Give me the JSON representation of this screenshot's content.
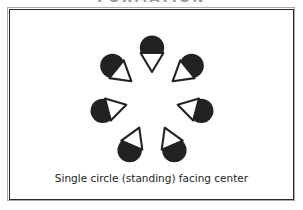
{
  "heading": {
    "text": "FORMATION",
    "clipped": true,
    "color": "#9a9a9a"
  },
  "frame": {
    "outer_border_color": "#a9a9a9",
    "inner_border_color": "#2b2b2b",
    "background_color": "#ffffff"
  },
  "caption": {
    "text": "Single circle (standing) facing center",
    "color": "#1d1d1d"
  },
  "diagram": {
    "type": "formation-diagram",
    "name": "single-circle-facing-center",
    "dancer_count": 7,
    "symbol_description": "filled black circle (head) with white outlined triangle (body) pointing toward circle center",
    "colors": {
      "body_fill": "#222222",
      "triangle_fill": "#ffffff",
      "triangle_stroke": "#222222"
    },
    "center": {
      "x": 142,
      "y": 88
    },
    "radius": 47,
    "dancers": [
      {
        "label": "dancer-top",
        "angle_deg": 90,
        "cx": 142,
        "cy": 41,
        "facing": "down"
      },
      {
        "label": "dancer-top-left",
        "angle_deg": 141,
        "cx": 105,
        "cy": 58,
        "facing": "down-right"
      },
      {
        "label": "dancer-top-right",
        "angle_deg": 39,
        "cx": 179,
        "cy": 58,
        "facing": "down-left"
      },
      {
        "label": "dancer-left",
        "angle_deg": 193,
        "cx": 96,
        "cy": 100,
        "facing": "right"
      },
      {
        "label": "dancer-right",
        "angle_deg": 347,
        "cx": 188,
        "cy": 100,
        "facing": "left"
      },
      {
        "label": "dancer-bottom-left",
        "angle_deg": 243,
        "cx": 121,
        "cy": 137,
        "facing": "up-right"
      },
      {
        "label": "dancer-bottom-right",
        "angle_deg": 297,
        "cx": 163,
        "cy": 137,
        "facing": "up-left"
      }
    ]
  }
}
